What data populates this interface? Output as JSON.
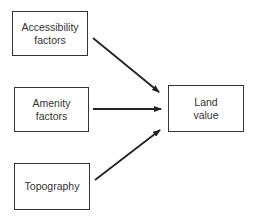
{
  "diagram": {
    "nodes": [
      {
        "id": "accessibility",
        "lines": [
          "Accessibility",
          "factors"
        ]
      },
      {
        "id": "amenity",
        "lines": [
          "Amenity",
          "factors"
        ]
      },
      {
        "id": "topography",
        "lines": [
          "Topography"
        ]
      },
      {
        "id": "land_value",
        "lines": [
          "Land",
          "value"
        ]
      }
    ],
    "edges": [
      {
        "from": "accessibility",
        "to": "land_value"
      },
      {
        "from": "amenity",
        "to": "land_value"
      },
      {
        "from": "topography",
        "to": "land_value"
      }
    ],
    "colors": {
      "stroke": "#222222",
      "text": "#333333",
      "background": "#ffffff"
    }
  }
}
